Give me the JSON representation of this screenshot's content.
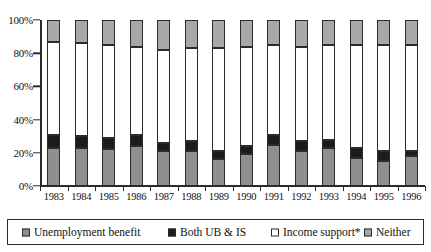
{
  "chart_data": {
    "type": "bar",
    "subtype": "100% stacked column",
    "title": "",
    "xlabel": "",
    "ylabel": "",
    "ylim": [
      0,
      100
    ],
    "y_unit": "%",
    "grid": false,
    "legend_position": "bottom",
    "categories": [
      "1983",
      "1984",
      "1985",
      "1986",
      "1987",
      "1988",
      "1989",
      "1990",
      "1991",
      "1992",
      "1993",
      "1994",
      "1995",
      "1996"
    ],
    "ytick_labels": [
      "0%",
      "20%",
      "40%",
      "60%",
      "80%",
      "100%"
    ],
    "ytick_values": [
      0,
      20,
      40,
      60,
      80,
      100
    ],
    "series": [
      {
        "name": "Unemployment benefit",
        "color": "#8f8f8f",
        "values": [
          23,
          23,
          22,
          24,
          21,
          21,
          16,
          19,
          25,
          21,
          23,
          17,
          15,
          18
        ]
      },
      {
        "name": "Both UB & IS",
        "color": "#1c1c1c",
        "values": [
          8,
          7,
          7,
          7,
          5,
          6,
          5,
          5,
          6,
          6,
          5,
          6,
          6,
          3
        ]
      },
      {
        "name": "Income support*",
        "color": "#ffffff",
        "values": [
          56,
          56,
          56,
          53,
          56,
          56,
          62,
          60,
          54,
          57,
          57,
          62,
          64,
          64
        ]
      },
      {
        "name": "Neither",
        "color": "#a8a8a8",
        "values": [
          13,
          14,
          15,
          16,
          18,
          17,
          17,
          16,
          15,
          16,
          15,
          15,
          15,
          15
        ]
      }
    ]
  },
  "legend": {
    "items": [
      {
        "label": "Unemployment benefit",
        "swatch": "sw-ub"
      },
      {
        "label": "Both UB & IS",
        "swatch": "sw-both"
      },
      {
        "label": "Income support*",
        "swatch": "sw-is"
      },
      {
        "label": "Neither",
        "swatch": "sw-neither"
      }
    ]
  }
}
